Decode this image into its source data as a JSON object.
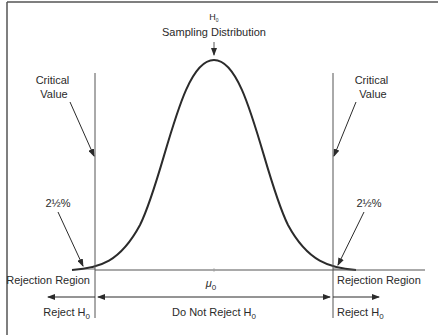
{
  "diagram": {
    "title_top": "H",
    "title_top_sub": "0",
    "title": "Sampling Distribution",
    "critical_left": [
      "Critical",
      "Value"
    ],
    "critical_right": [
      "Critical",
      "Value"
    ],
    "tail_left": "2½%",
    "tail_right": "2½%",
    "rejection_left": "Rejection Region",
    "rejection_right": "Rejection Region",
    "mu": "μ",
    "mu_sub": "0",
    "reject_left": "Reject H",
    "reject_left_sub": "0",
    "do_not_reject": "Do Not Reject H",
    "do_not_reject_sub": "0",
    "reject_right": "Reject H",
    "reject_right_sub": "0",
    "colors": {
      "line": "#2b2b2b",
      "shade": "#b5b5b5",
      "frame": "#555555"
    }
  }
}
